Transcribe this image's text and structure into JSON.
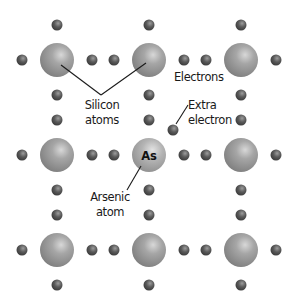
{
  "diagram": {
    "labels": {
      "silicon_line1": "Silicon",
      "silicon_line2": "atoms",
      "electrons": "Electrons",
      "extra_line1": "Extra",
      "extra_line2": "electron",
      "arsenic_line1": "Arsenic",
      "arsenic_line2": "atom",
      "arsenic_symbol": "As"
    },
    "lattice": {
      "rows": 3,
      "cols": 3,
      "atom_columns_x": [
        57,
        149,
        241
      ],
      "atom_rows_y": [
        60,
        155,
        250
      ],
      "atom_radius": 17,
      "dopant_position": {
        "row": 1,
        "col": 1
      },
      "electron_radius": 5.5
    },
    "extra_electron": {
      "x": 173,
      "y": 130
    },
    "colors": {
      "atom": "#8e8e8e",
      "atom_highlight": "#d6d6d6",
      "arsenic_atom": "#a4a4a4",
      "electron": "#4a4a4a",
      "electron_highlight": "#9a9a9a",
      "leader_line": "#1a1a1a",
      "background": "#ffffff"
    }
  }
}
